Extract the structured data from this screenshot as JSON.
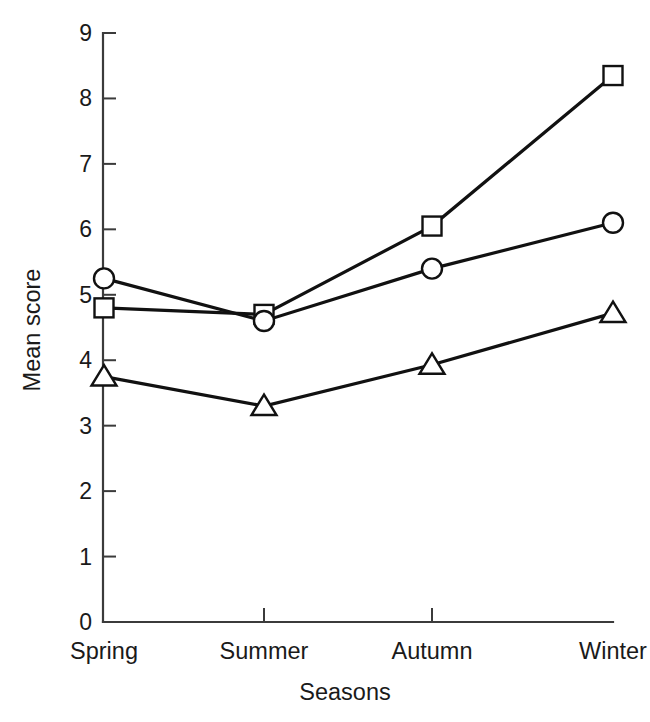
{
  "chart_data": {
    "type": "line",
    "title": "",
    "xlabel": "Seasons",
    "ylabel": "Mean score",
    "categories": [
      "Spring",
      "Summer",
      "Autumn",
      "Winter"
    ],
    "ylim": [
      0,
      9
    ],
    "yticks": [
      0,
      1,
      2,
      3,
      4,
      5,
      6,
      7,
      8,
      9
    ],
    "ytick_labels": [
      "0",
      "1",
      "2",
      "3",
      "4",
      "5",
      "6",
      "7",
      "8",
      "9"
    ],
    "grid": false,
    "legend": "none",
    "series": [
      {
        "name": "square-series",
        "marker": "square",
        "values": [
          4.8,
          4.7,
          6.05,
          8.35
        ]
      },
      {
        "name": "circle-series",
        "marker": "circle",
        "values": [
          5.25,
          4.6,
          5.4,
          6.1
        ]
      },
      {
        "name": "triangle-series",
        "marker": "triangle",
        "values": [
          3.75,
          3.3,
          3.93,
          4.72
        ]
      }
    ],
    "colors": {
      "line": "#111111",
      "marker_fill": "#ffffff",
      "axis": "#3b3b3b",
      "text": "#1a1a1a",
      "background": "#ffffff"
    }
  }
}
